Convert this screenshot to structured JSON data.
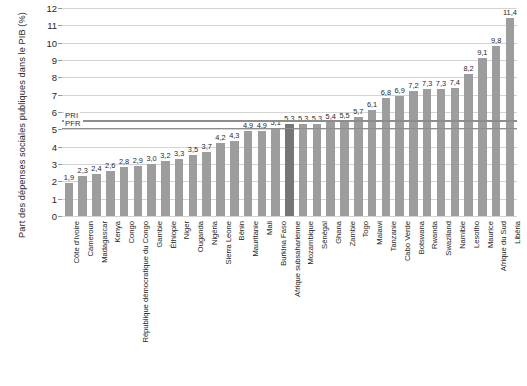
{
  "chart_data": {
    "type": "bar",
    "title": "",
    "subtitle": "",
    "xlabel": "",
    "ylabel": "Part des dépenses sociales publiques dans le PIB (%)",
    "ylim": [
      0,
      12
    ],
    "yticks": [
      "0",
      "1",
      "2",
      "3",
      "4",
      "5",
      "6",
      "7",
      "8",
      "9",
      "10",
      "11",
      "12"
    ],
    "grid": true,
    "legend": "none",
    "bar_color": "#9d9d9d",
    "highlight_color": "#767676",
    "highlight_category": "Afrique subsaharienne",
    "categories": [
      "Côte d'Ivoire",
      "Cameroun",
      "Madagascar",
      "Kenya",
      "Congo",
      "République démocratique du Congo",
      "Gambie",
      "Éthiopie",
      "Niger",
      "Ouganda",
      "Nigéria",
      "Sierra Leone",
      "Bénin",
      "Mauritanie",
      "Mali",
      "Burkina Faso",
      "Afrique subsaharienne",
      "Mozambique",
      "Sénégal",
      "Ghana",
      "Zambie",
      "Togo",
      "Malawi",
      "Tanzanie",
      "Cabo Verde",
      "Botswana",
      "Rwanda",
      "Swaziland",
      "Namibie",
      "Lesotho",
      "Maurice",
      "Afrique du Sud",
      "Libéria"
    ],
    "values": [
      1.9,
      2.3,
      2.4,
      2.6,
      2.8,
      2.9,
      3.0,
      3.2,
      3.3,
      3.5,
      3.7,
      4.2,
      4.3,
      4.9,
      4.9,
      5.1,
      5.3,
      5.3,
      5.3,
      5.4,
      5.5,
      5.7,
      6.1,
      6.8,
      6.9,
      7.2,
      7.3,
      7.3,
      7.4,
      8.2,
      9.1,
      9.8,
      11.4
    ],
    "value_labels": [
      "1,9",
      "2,3",
      "2,4",
      "2,6",
      "2,8",
      "2,9",
      "3,0",
      "3,2",
      "3,3",
      "3,5",
      "3,7",
      "4,2",
      "4,3",
      "4,9",
      "4,9",
      "5,1",
      "5,3",
      "5,3",
      "5,3",
      "5,4",
      "5,5",
      "5,7",
      "6,1",
      "6,8",
      "6,9",
      "7,2",
      "7,3",
      "7,3",
      "7,4",
      "8,2",
      "9,1",
      "9,8",
      "11,4"
    ],
    "reference_lines": [
      {
        "label": "PRI",
        "value": 5.52
      },
      {
        "label": "PFR",
        "value": 5.08
      }
    ]
  }
}
